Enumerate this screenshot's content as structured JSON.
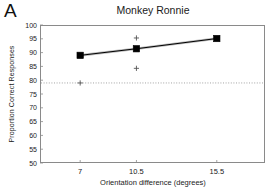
{
  "panel": {
    "letter": "A"
  },
  "chart_data": {
    "type": "line",
    "title": "Monkey Ronnie",
    "xlabel": "Orientation difference (degrees)",
    "ylabel": "Proportion Correct Responses",
    "x": [
      7,
      10.5,
      15.5
    ],
    "xticklabels": [
      "7",
      "10.5",
      "15.5"
    ],
    "xlim": [
      4.5,
      18.5
    ],
    "ylim": [
      50,
      100
    ],
    "yticks": [
      50,
      55,
      60,
      65,
      70,
      75,
      80,
      85,
      90,
      95,
      100
    ],
    "yticklabels": [
      "50",
      "55",
      "60",
      "65",
      "70",
      "75",
      "80",
      "85",
      "90",
      "95",
      "100"
    ],
    "grid": false,
    "legend": "none",
    "series": [
      {
        "name": "Mean proportion correct",
        "marker": "filled-square",
        "line": "solid",
        "color": "#000000",
        "values": [
          89.0,
          91.4,
          95.1
        ]
      },
      {
        "name": "Individual sessions",
        "marker": "plus",
        "line": "none",
        "color": "#555555",
        "points": [
          {
            "x": 7,
            "y": 79.0
          },
          {
            "x": 10.5,
            "y": 95.3
          },
          {
            "x": 10.5,
            "y": 84.3
          }
        ]
      }
    ],
    "reference_lines": [
      {
        "name": "chance-threshold",
        "orientation": "horizontal",
        "y": 79.0,
        "style": "dotted",
        "color": "#9a9a9a"
      }
    ]
  }
}
